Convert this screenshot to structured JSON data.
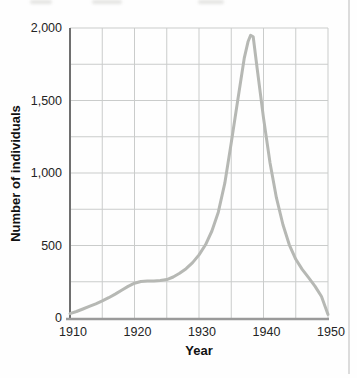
{
  "figure": {
    "background": "#fefefe",
    "page_edge_color": "#dcdcdc"
  },
  "chart_data": {
    "type": "line",
    "title": "",
    "xlabel": "Year",
    "ylabel": "Number of individuals",
    "xlim": [
      1910,
      1950
    ],
    "ylim": [
      0,
      2000
    ],
    "x_grid_step": 5,
    "y_grid_step": 250,
    "grid": true,
    "legend_position": "none",
    "x_ticks": [
      {
        "value": 1910,
        "label": "1910"
      },
      {
        "value": 1920,
        "label": "1920"
      },
      {
        "value": 1930,
        "label": "1930"
      },
      {
        "value": 1940,
        "label": "1940"
      },
      {
        "value": 1950,
        "label": "1950"
      }
    ],
    "y_ticks": [
      {
        "value": 0,
        "label": "0"
      },
      {
        "value": 500,
        "label": "500"
      },
      {
        "value": 1000,
        "label": "1,000"
      },
      {
        "value": 1500,
        "label": "1,500"
      },
      {
        "value": 2000,
        "label": "2,000"
      }
    ],
    "colors": {
      "line": "#b6b8b4",
      "grid": "#cacccb",
      "y_axis": "#6f6f6f",
      "x_axis": "#9a9a9a",
      "tick_text": "#242424"
    },
    "series": [
      {
        "name": "Number of individuals",
        "x": [
          1910,
          1911,
          1912,
          1913,
          1914,
          1915,
          1916,
          1917,
          1918,
          1919,
          1920,
          1921,
          1922,
          1923,
          1924,
          1925,
          1926,
          1927,
          1928,
          1929,
          1930,
          1931,
          1932,
          1933,
          1934,
          1935,
          1936,
          1937,
          1937.6,
          1938,
          1938.4,
          1939,
          1940,
          1941,
          1942,
          1943,
          1944,
          1945,
          1946,
          1947,
          1948,
          1949,
          1950
        ],
        "y": [
          30,
          45,
          62,
          80,
          98,
          118,
          140,
          165,
          192,
          218,
          240,
          252,
          255,
          255,
          258,
          265,
          283,
          308,
          340,
          382,
          435,
          505,
          600,
          730,
          930,
          1210,
          1500,
          1790,
          1905,
          1950,
          1940,
          1730,
          1380,
          1070,
          830,
          645,
          505,
          405,
          335,
          278,
          218,
          148,
          25
        ]
      }
    ]
  }
}
